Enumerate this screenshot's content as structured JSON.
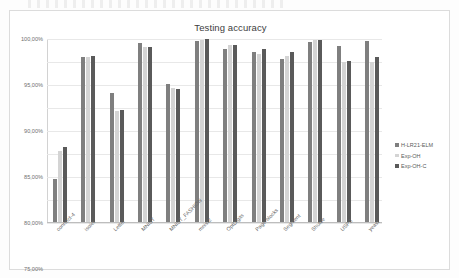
{
  "chart_data": {
    "type": "bar",
    "title": "Testing accuracy",
    "xlabel": "",
    "ylabel": "",
    "ylim": [
      60,
      100
    ],
    "ytick_labels": [
      "100,00%",
      "95,00%",
      "90,00%",
      "85,00%",
      "80,00%",
      "75,00%",
      "70,00%",
      "65,00%",
      "60,00%"
    ],
    "ytick_values": [
      100,
      95,
      90,
      85,
      80,
      75,
      70,
      65,
      60
    ],
    "grid": true,
    "legend_position": "right",
    "categories": [
      "connect-4",
      "isolet",
      "Letter",
      "MNIST",
      "MNIST_FASHION",
      "mnist2",
      "OptDigits",
      "Page-blocks",
      "Segment",
      "Shuttle",
      "USPS",
      "yeast"
    ],
    "series": [
      {
        "name": "H-LR21-ELM",
        "color": "#7f7f7f",
        "values": [
          69.5,
          96.0,
          88.3,
          99.1,
          90.2,
          99.6,
          97.8,
          97.2,
          95.7,
          99.3,
          98.4,
          99.6
        ]
      },
      {
        "name": "Exp-OH",
        "color": "#d4d4d4",
        "values": [
          75.5,
          96.0,
          84.2,
          98.3,
          89.2,
          99.8,
          98.6,
          96.8,
          96.3,
          99.7,
          94.9,
          95.0
        ]
      },
      {
        "name": "Exp-OH-C",
        "color": "#5a5a5a",
        "values": [
          76.5,
          96.3,
          84.5,
          98.3,
          89.1,
          100.0,
          98.8,
          97.9,
          97.1,
          99.8,
          95.1,
          96.1
        ]
      }
    ]
  }
}
